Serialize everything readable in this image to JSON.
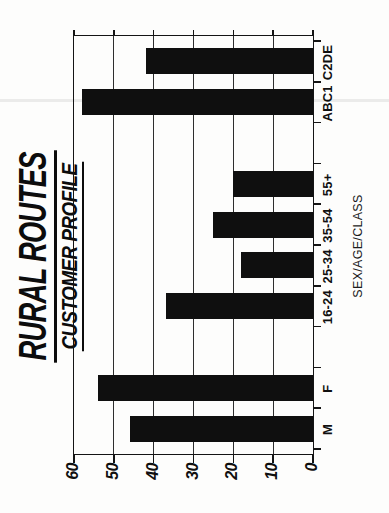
{
  "page": {
    "background": "#fdfdfc"
  },
  "header": {
    "title": "RURAL ROUTES",
    "subtitle": "CUSTOMER PROFILE"
  },
  "chart_data": {
    "type": "bar",
    "title": "RURAL ROUTES",
    "subtitle": "CUSTOMER PROFILE",
    "categories": [
      "M",
      "F",
      "16-24",
      "25-34",
      "35-54",
      "55+",
      "ABC1",
      "C2DE"
    ],
    "values": [
      46,
      54,
      37,
      18,
      25,
      20,
      58,
      42
    ],
    "category_groups": [
      [
        "M",
        "F"
      ],
      [
        "16-24",
        "25-34",
        "35-54",
        "55+"
      ],
      [
        "ABC1",
        "C2DE"
      ]
    ],
    "xlabel": "SEX/AGE/CLASS",
    "ylabel": "",
    "ylim": [
      0,
      60
    ],
    "yticks": [
      0,
      10,
      20,
      30,
      40,
      50,
      60
    ],
    "grid": true,
    "legend": "none",
    "bar_color": "#0f0f0f",
    "axis_color": "#141414",
    "orientation": "landscape chart rotated 90deg counter-clockwise on portrait page",
    "slot_of_category": [
      0,
      1,
      3,
      4,
      5,
      6,
      8,
      9
    ],
    "total_slots": 10
  }
}
